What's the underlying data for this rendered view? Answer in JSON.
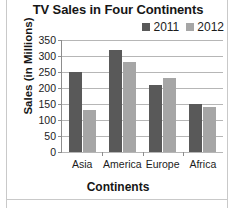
{
  "chart_data": {
    "type": "bar",
    "title": "TV Sales in Four Continents",
    "xlabel": "Continents",
    "ylabel": "Sales (in Millions)",
    "categories": [
      "Asia",
      "America",
      "Europe",
      "Africa"
    ],
    "series": [
      {
        "name": "2011",
        "color": "#595959",
        "values": [
          250,
          320,
          210,
          150
        ]
      },
      {
        "name": "2012",
        "color": "#a6a6a6",
        "values": [
          130,
          280,
          230,
          140
        ]
      }
    ],
    "ylim": [
      0,
      350
    ],
    "yticks": [
      0,
      50,
      100,
      150,
      200,
      250,
      300,
      350
    ],
    "ytick_labels": [
      "0",
      "50",
      "100",
      "150",
      "200",
      "250",
      "300",
      "350"
    ],
    "grid": true,
    "legend_position": "top-right"
  }
}
